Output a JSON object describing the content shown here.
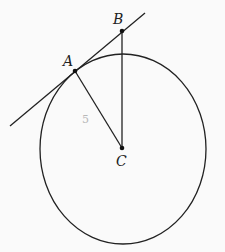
{
  "diagram": {
    "points": {
      "A": {
        "label": "A",
        "x": 75,
        "y": 71
      },
      "B": {
        "label": "B",
        "x": 122,
        "y": 31
      },
      "C": {
        "label": "C",
        "x": 122,
        "y": 148
      }
    },
    "circle": {
      "cx": 123,
      "cy": 149,
      "rx": 83,
      "ry": 95
    },
    "tangent_line": {
      "x1": 10,
      "y1": 126,
      "x2": 145,
      "y2": 13
    },
    "segments": [
      {
        "from": "A",
        "to": "C"
      },
      {
        "from": "B",
        "to": "C"
      }
    ],
    "annotations": {
      "segment_AC_length": "5"
    },
    "colors": {
      "stroke": "#222222",
      "background": "#fafafa",
      "annotation": "#b8b8b8"
    }
  }
}
